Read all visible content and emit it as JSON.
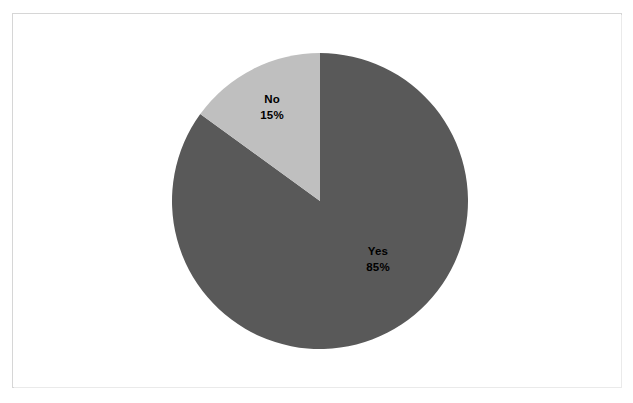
{
  "canvas": {
    "background_color": "#ffffff",
    "width": 633,
    "height": 403
  },
  "frame": {
    "border_color": "#d6d6d6",
    "fill_color": "#ffffff"
  },
  "chart_data": {
    "type": "pie",
    "title": "",
    "subtitle": "",
    "xlabel": "",
    "ylabel": "",
    "grid": false,
    "legend_position": "none",
    "labels_inside_slices": true,
    "start_angle_deg": 0,
    "direction": "clockwise",
    "center": {
      "x": 320,
      "y": 201
    },
    "radius": 148,
    "categories": [
      "Yes",
      "No"
    ],
    "values": [
      85,
      15
    ],
    "value_unit": "%",
    "slices": [
      {
        "name": "Yes",
        "label": "Yes",
        "value": 85,
        "value_label": "85%",
        "color": "#595959",
        "sweep_deg": 306
      },
      {
        "name": "No",
        "label": "No",
        "value": 15,
        "value_label": "15%",
        "color": "#bfbfbf",
        "sweep_deg": 54
      }
    ],
    "annotations": []
  }
}
